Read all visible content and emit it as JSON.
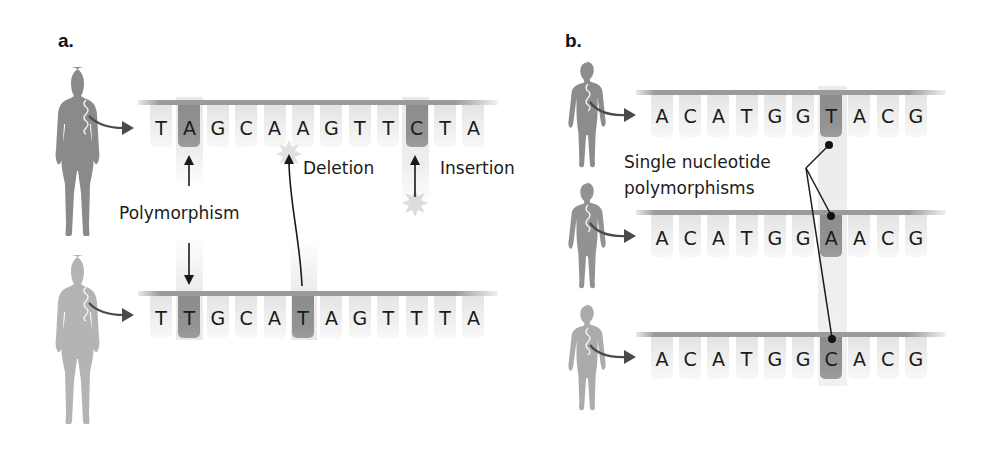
{
  "panels": {
    "a": {
      "label": "a.",
      "rows": [
        {
          "person": "woman-dark",
          "sequence": [
            "T",
            "A",
            "G",
            "C",
            "A",
            "A",
            "G",
            "T",
            "T",
            "C",
            "T",
            "A"
          ],
          "highlight": [
            1,
            9
          ]
        },
        {
          "person": "woman-light",
          "sequence": [
            "T",
            "T",
            "G",
            "C",
            "A",
            "T",
            "A",
            "G",
            "T",
            "T",
            "T",
            "A"
          ],
          "highlight": [
            1,
            5
          ]
        }
      ],
      "annotations": {
        "polymorphism": "Polymorphism",
        "deletion": "Deletion",
        "insertion": "Insertion"
      }
    },
    "b": {
      "label": "b.",
      "rows": [
        {
          "person": "man-1",
          "sequence": [
            "A",
            "C",
            "A",
            "T",
            "G",
            "G",
            "T",
            "A",
            "C",
            "G"
          ],
          "highlight": [
            6
          ]
        },
        {
          "person": "man-2",
          "sequence": [
            "A",
            "C",
            "A",
            "T",
            "G",
            "G",
            "A",
            "A",
            "C",
            "G"
          ],
          "highlight": [
            6
          ]
        },
        {
          "person": "man-3",
          "sequence": [
            "A",
            "C",
            "A",
            "T",
            "G",
            "G",
            "C",
            "A",
            "C",
            "G"
          ],
          "highlight": [
            6
          ]
        }
      ],
      "annotations": {
        "snp_line1": "Single nucleotide",
        "snp_line2": "polymorphisms"
      }
    }
  },
  "colors": {
    "figure_dark": "#8a8a8a",
    "figure_light": "#b4b4b4",
    "highlight_tile": "#8f8f8f",
    "tile": "#ececec",
    "backbone": "#9b9b9b",
    "arrow": "#4a4a4a"
  }
}
